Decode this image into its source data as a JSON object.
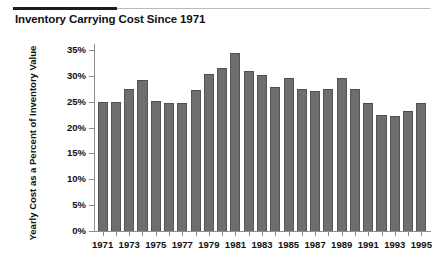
{
  "figure": {
    "title": "Inventory Carrying Cost Since 1971"
  },
  "chart_data": {
    "type": "bar",
    "title": "Inventory Carrying Cost Since 1971",
    "subtitle": "",
    "xlabel": "",
    "ylabel": "Yearly Cost as a Percent of Inventory Value",
    "ylim": [
      0,
      35
    ],
    "ytick_labels": [
      "0%",
      "5%",
      "10%",
      "15%",
      "20%",
      "25%",
      "30%",
      "35%"
    ],
    "ytick_values": [
      0,
      5,
      10,
      15,
      20,
      25,
      30,
      35
    ],
    "xtick_labels": [
      "1971",
      "1973",
      "1975",
      "1977",
      "1979",
      "1981",
      "1983",
      "1985",
      "1987",
      "1989",
      "1991",
      "1993",
      "1995"
    ],
    "grid": false,
    "legend": false,
    "units": "percent",
    "bar_color": "#6e6e6e",
    "categories": [
      "1971",
      "1972",
      "1973",
      "1974",
      "1975",
      "1976",
      "1977",
      "1978",
      "1979",
      "1980",
      "1981",
      "1982",
      "1983",
      "1984",
      "1985",
      "1986",
      "1987",
      "1988",
      "1989",
      "1990",
      "1991",
      "1992",
      "1993",
      "1994",
      "1995"
    ],
    "values": [
      25.0,
      25.0,
      27.5,
      29.2,
      25.2,
      24.7,
      24.8,
      27.3,
      30.4,
      31.6,
      34.5,
      31.0,
      30.1,
      27.9,
      29.6,
      27.4,
      27.1,
      27.4,
      29.6,
      27.4,
      24.8,
      22.5,
      22.3,
      23.2,
      24.7
    ],
    "series": [
      {
        "name": "Yearly Cost as a Percent of Inventory Value",
        "values": [
          25.0,
          25.0,
          27.5,
          29.2,
          25.2,
          24.7,
          24.8,
          27.3,
          30.4,
          31.6,
          34.5,
          31.0,
          30.1,
          27.9,
          29.6,
          27.4,
          27.1,
          27.4,
          29.6,
          27.4,
          24.8,
          22.5,
          22.3,
          23.2,
          24.7
        ]
      }
    ]
  }
}
